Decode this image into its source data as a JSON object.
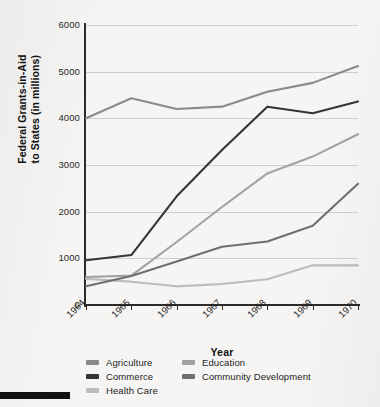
{
  "chart_data": {
    "type": "line",
    "title": "",
    "xlabel": "Year",
    "ylabel": "Federal Grants-in-Aid to States (in millions)",
    "categories": [
      "1964",
      "1965",
      "1966",
      "1967",
      "1968",
      "1969",
      "1970"
    ],
    "x": [
      1964,
      1965,
      1966,
      1967,
      1968,
      1969,
      1970
    ],
    "ylim": [
      0,
      6000
    ],
    "yticks": [
      0,
      1000,
      2000,
      3000,
      4000,
      5000,
      6000
    ],
    "ytick_labels": [
      "0",
      "1000",
      "2000",
      "3000",
      "4000",
      "5000",
      "6000"
    ],
    "grid": "horizontal",
    "legend_position": "below-axis",
    "series": [
      {
        "name": "Agriculture",
        "color": "#8a8a8a",
        "values": [
          4000,
          4430,
          4200,
          4250,
          4570,
          4760,
          5120
        ]
      },
      {
        "name": "Commerce",
        "color": "#343434",
        "values": [
          960,
          1070,
          2330,
          3320,
          4250,
          4110,
          4360
        ]
      },
      {
        "name": "Health Care",
        "color": "#bcbcbc",
        "values": [
          560,
          500,
          400,
          450,
          550,
          850,
          850
        ]
      },
      {
        "name": "Education",
        "color": "#a2a2a2",
        "values": [
          600,
          630,
          1350,
          2100,
          2820,
          3180,
          3660
        ]
      },
      {
        "name": "Community Development",
        "color": "#6f6f6f",
        "values": [
          400,
          620,
          930,
          1250,
          1360,
          1700,
          2600
        ]
      }
    ]
  },
  "axes": {
    "y_title": "Federal Grants-in-Aid to States (in millions)",
    "y_title_line1": "Federal Grants-in-Aid",
    "y_title_line2": "to States (in millions)",
    "x_title": "Year"
  },
  "legend": {
    "left_column": [
      {
        "label": "Agriculture",
        "color": "#8a8a8a"
      },
      {
        "label": "Commerce",
        "color": "#343434"
      },
      {
        "label": "Health Care",
        "color": "#bcbcbc"
      }
    ],
    "right_column": [
      {
        "label": "Education",
        "color": "#a2a2a2"
      },
      {
        "label": "Community Development",
        "color": "#6f6f6f"
      }
    ]
  },
  "artifacts": {
    "scan_bar_color": "#111111",
    "page_background": "#f6f5f3"
  }
}
